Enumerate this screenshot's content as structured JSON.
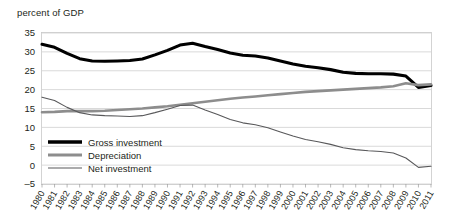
{
  "chart_data": {
    "type": "line",
    "title": "percent of GDP",
    "xlabel": "",
    "ylabel": "",
    "ylim": [
      -5,
      35
    ],
    "yticks": [
      -5,
      0,
      5,
      10,
      15,
      20,
      25,
      30,
      35
    ],
    "grid": true,
    "legend_position": "inside-bottom-left",
    "categories": [
      "1980",
      "1981",
      "1982",
      "1983",
      "1984",
      "1985",
      "1986",
      "1987",
      "1988",
      "1989",
      "1990",
      "1991",
      "1992",
      "1993",
      "1994",
      "1995",
      "1996",
      "1997",
      "1998",
      "1999",
      "2000",
      "2001",
      "2002",
      "2003",
      "2004",
      "2005",
      "2006",
      "2007",
      "2008",
      "2009",
      "2010",
      "2011"
    ],
    "series": [
      {
        "name": "Gross investment",
        "color": "#000000",
        "values": [
          32.0,
          31.2,
          29.6,
          28.2,
          27.6,
          27.5,
          27.6,
          27.7,
          28.1,
          29.2,
          30.4,
          31.8,
          32.3,
          31.4,
          30.6,
          29.7,
          29.1,
          28.9,
          28.4,
          27.6,
          26.8,
          26.2,
          25.8,
          25.3,
          24.6,
          24.3,
          24.2,
          24.2,
          24.1,
          23.6,
          20.6,
          21.1
        ]
      },
      {
        "name": "Depreciation",
        "color": "#8d8d8d",
        "values": [
          14.0,
          14.1,
          14.3,
          14.3,
          14.3,
          14.4,
          14.6,
          14.8,
          15.0,
          15.3,
          15.6,
          16.0,
          16.4,
          16.8,
          17.2,
          17.6,
          17.9,
          18.2,
          18.5,
          18.8,
          19.1,
          19.4,
          19.6,
          19.8,
          20.0,
          20.2,
          20.4,
          20.6,
          20.9,
          21.7,
          21.2,
          21.4
        ]
      },
      {
        "name": "Net investment",
        "color": "#58585a",
        "values": [
          18.0,
          17.1,
          15.3,
          13.9,
          13.3,
          13.1,
          13.0,
          12.9,
          13.1,
          13.9,
          14.8,
          15.8,
          15.9,
          14.6,
          13.4,
          12.1,
          11.2,
          10.7,
          9.9,
          8.8,
          7.7,
          6.8,
          6.2,
          5.5,
          4.6,
          4.1,
          3.8,
          3.6,
          3.2,
          1.9,
          -0.6,
          -0.3
        ]
      }
    ]
  },
  "legend": {
    "items": [
      {
        "label": "Gross investment"
      },
      {
        "label": "Depreciation"
      },
      {
        "label": "Net investment"
      }
    ]
  }
}
